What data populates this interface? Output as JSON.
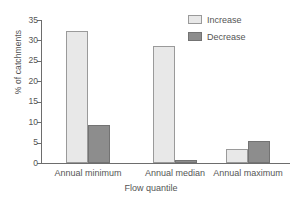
{
  "chart_data": {
    "type": "bar",
    "title": "",
    "subtitle": "",
    "xlabel": "Flow quantile",
    "ylabel": "% of catchments",
    "categories": [
      "Annual minimum",
      "Annual median",
      "Annual maximum"
    ],
    "series": [
      {
        "name": "Increase",
        "color": "#e8e8e8",
        "values": [
          32.3,
          28.6,
          3.5
        ]
      },
      {
        "name": "Decrease",
        "color": "#8d8d8d",
        "values": [
          9.4,
          0.7,
          5.4
        ]
      }
    ],
    "ylim": [
      0,
      35
    ],
    "ytick_values": [
      0,
      5,
      10,
      15,
      20,
      25,
      30,
      35
    ],
    "ytick_labels": [
      "0",
      "5",
      "10",
      "15",
      "20",
      "25",
      "30",
      "35"
    ],
    "grid": false,
    "legend_position": "top-right",
    "legend_entries": [
      "Increase",
      "Decrease"
    ],
    "annotations": []
  },
  "axes": {
    "y_title": "% of catchments",
    "x_title": "Flow quantile"
  },
  "legend": {
    "items": [
      {
        "label": "Increase",
        "swatch": "increase-swatch"
      },
      {
        "label": "Decrease",
        "swatch": "decrease-swatch"
      }
    ]
  }
}
